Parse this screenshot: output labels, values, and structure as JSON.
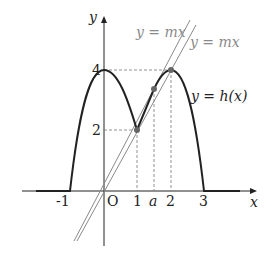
{
  "diagram": {
    "axes": {
      "x_label": "x",
      "y_label": "y",
      "origin_label": "O",
      "x_ticks": [
        "-1",
        "1",
        "a",
        "2",
        "3"
      ],
      "y_ticks": [
        "2",
        "4"
      ]
    },
    "curve": {
      "label": "y = h(x)",
      "key_points": [
        {
          "x": -1,
          "y": 0
        },
        {
          "x": 0,
          "y": 4
        },
        {
          "x": 1,
          "y": 2
        },
        {
          "x": 2,
          "y": 4
        },
        {
          "x": 3,
          "y": 0
        }
      ]
    },
    "lines": [
      {
        "label": "y = mx",
        "note": "line through origin and point at x = a"
      },
      {
        "label": "y = mx",
        "note": "line through origin and point (1, 2)"
      }
    ],
    "marked_points": [
      {
        "x": "1",
        "y": "2"
      },
      {
        "x": "a",
        "y": ""
      },
      {
        "x": "2",
        "y": "4"
      }
    ],
    "colors": {
      "curve": "#222222",
      "lines": "#8a8a8a",
      "axes": "#222222",
      "dashed": "#777777",
      "points": "#666666"
    }
  }
}
